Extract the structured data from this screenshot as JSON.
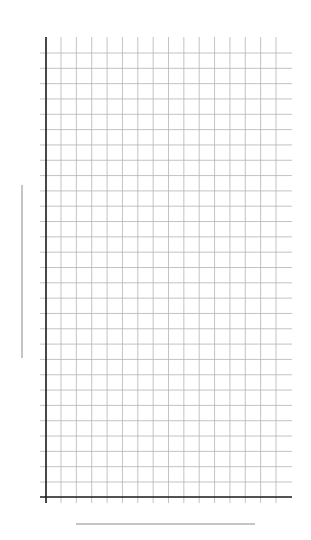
{
  "chart_data": {
    "type": "line",
    "title": "",
    "xlabel": "",
    "ylabel": "",
    "series": [],
    "grid": true,
    "grid_columns": 14,
    "grid_rows": 28,
    "x_tick_labels": [],
    "y_tick_labels": [],
    "legend": null,
    "note": "Empty grid chart; axis labels rendered as placeholder lines"
  },
  "colors": {
    "axis": "#1a1a1a",
    "grid": "#b4b4b4",
    "label_placeholder": "#8a8a8a",
    "background": "#ffffff"
  }
}
